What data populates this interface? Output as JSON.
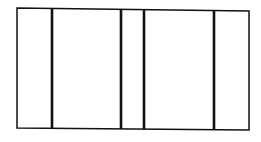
{
  "diagram": {
    "type": "partitioned-rectangle",
    "background": "#ffffff",
    "stroke_color": "#111111",
    "outer": {
      "points": [
        [
          17,
          8
        ],
        [
          249,
          11
        ],
        [
          249,
          130
        ],
        [
          17,
          128
        ]
      ],
      "stroke_width": 1.5
    },
    "dividers": [
      {
        "x_top": 52,
        "x_bottom": 52,
        "y_top": 8.5,
        "y_bottom": 128.2,
        "stroke_width": 2.6
      },
      {
        "x_top": 121,
        "x_bottom": 121,
        "y_top": 9.5,
        "y_bottom": 128.9,
        "stroke_width": 2.6
      },
      {
        "x_top": 144,
        "x_bottom": 144,
        "y_top": 9.8,
        "y_bottom": 129.1,
        "stroke_width": 2.6
      },
      {
        "x_top": 214,
        "x_bottom": 214,
        "y_top": 10.5,
        "y_bottom": 129.7,
        "stroke_width": 2.6
      }
    ],
    "sections": 5
  }
}
